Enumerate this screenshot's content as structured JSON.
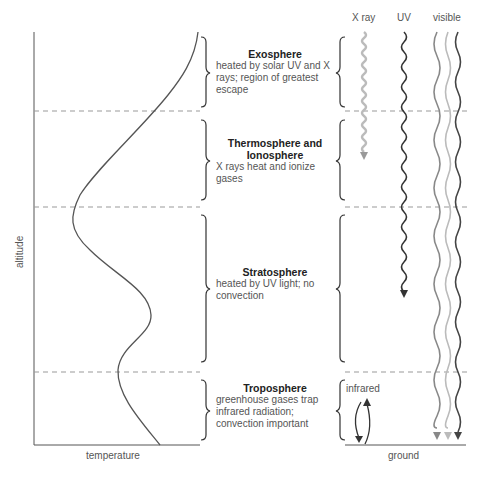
{
  "axes": {
    "x_label": "temperature",
    "y_label": "altitude",
    "ground_label": "ground"
  },
  "radiation": {
    "xray": "X ray",
    "uv": "UV",
    "visible": "visible",
    "infrared": "infrared"
  },
  "layers": [
    {
      "name": "Exosphere",
      "desc": "heated by solar UV and X rays; region of greatest escape"
    },
    {
      "name": "Thermosphere and Ionosphere",
      "desc": "X rays heat and ionize gases"
    },
    {
      "name": "Stratosphere",
      "desc": "heated by UV light; no convection"
    },
    {
      "name": "Troposphere",
      "desc": "greenhouse gases trap infrared radiation; convection important"
    }
  ],
  "colors": {
    "line": "#444444",
    "dash": "#999999",
    "xray": "#bbbbbb",
    "uv": "#333333",
    "visible_light": "#bbbbbb",
    "visible_mid": "#888888"
  }
}
